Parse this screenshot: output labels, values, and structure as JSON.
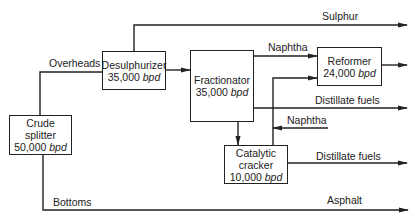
{
  "diagram": {
    "units": [
      {
        "id": "crude_splitter",
        "name_line1": "Crude",
        "name_line2": "splitter",
        "rate": "50,000",
        "unit": "bpd"
      },
      {
        "id": "desulphurizer",
        "name_line1": "Desulphurizer",
        "rate": "35,000",
        "unit": "bpd"
      },
      {
        "id": "fractionator",
        "name_line1": "Fractionator",
        "rate": "35,000",
        "unit": "bpd"
      },
      {
        "id": "reformer",
        "name_line1": "Reformer",
        "rate": "24,000",
        "unit": "bpd"
      },
      {
        "id": "catalytic_cracker",
        "name_line1": "Catalytic",
        "name_line2": "cracker",
        "rate": "10,000",
        "unit": "bpd"
      }
    ],
    "streams": {
      "overheads": "Overheads",
      "sulphur": "Sulphur",
      "naphtha_to_reformer": "Naphtha",
      "distillate_fuels_fractionator": "Distillate fuels",
      "naphtha_input": "Naphtha",
      "distillate_fuels_cracker": "Distillate fuels",
      "bottoms": "Bottoms",
      "asphalt": "Asphalt"
    },
    "colors": {
      "line": "#222222",
      "background": "#ffffff"
    }
  }
}
